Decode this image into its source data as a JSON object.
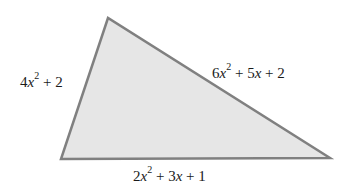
{
  "diagram": {
    "type": "triangle",
    "fill_color": "#e6e6e6",
    "stroke_color": "#808080",
    "vertices": {
      "top": [
        108,
        18
      ],
      "bottom_left": [
        61,
        159
      ],
      "bottom_right": [
        330,
        158
      ]
    },
    "sides": {
      "left": {
        "coef": "4",
        "var": "x",
        "exp": "2",
        "rest": " + 2",
        "full": "4x^2 + 2"
      },
      "right": {
        "coef": "6",
        "var": "x",
        "exp": "2",
        "rest_a": " + 5",
        "var2": "x",
        "rest_b": " + 2",
        "full": "6x^2 + 5x + 2"
      },
      "bottom": {
        "coef": "2",
        "var": "x",
        "exp": "2",
        "rest_a": " + 3",
        "var2": "x",
        "rest_b": " + 1",
        "full": "2x^2 + 3x + 1"
      }
    }
  }
}
